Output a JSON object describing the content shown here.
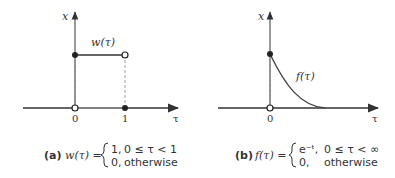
{
  "panel_a": {
    "y_axis_label": "x",
    "x_axis_label": "τ",
    "curve_label": "w(τ)",
    "tick_labels": [
      "0",
      "1"
    ],
    "caption": {
      "tag": "(a)",
      "lhs": "w(τ) =",
      "case1_value": "1,",
      "case1_cond": "0 ≤ τ < 1",
      "case2_value": "0,",
      "case2_cond": "otherwise"
    }
  },
  "panel_b": {
    "y_axis_label": "x",
    "x_axis_label": "τ",
    "curve_label": "f(τ)",
    "tick_labels": [
      "0"
    ],
    "caption": {
      "tag": "(b)",
      "lhs": "f(τ) =",
      "case1_value": "e⁻ᵗ,",
      "case1_cond": "0 ≤ τ < ∞",
      "case2_value": "0,",
      "case2_cond": "otherwise"
    }
  },
  "colors": {
    "line": "#333333",
    "curve": "#444444",
    "dashed": "#888888"
  }
}
